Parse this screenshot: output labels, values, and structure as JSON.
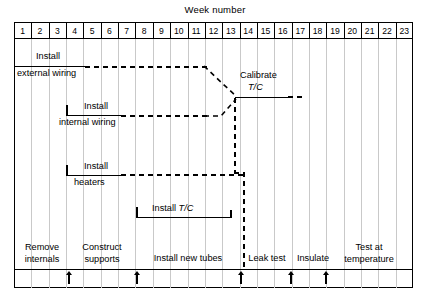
{
  "chart_data": {
    "type": "gantt",
    "title": "Week number",
    "xlabel": "Week number",
    "ylabel": "",
    "grid": true,
    "x_axis": {
      "label": "Week number",
      "ticks": [
        "1",
        "2",
        "3",
        "4",
        "5",
        "6",
        "7",
        "8",
        "9",
        "10",
        "11",
        "12",
        "13",
        "14",
        "15",
        "16",
        "17",
        "18",
        "19",
        "20",
        "21",
        "22",
        "23"
      ],
      "range": [
        1,
        23
      ],
      "unit": "week"
    },
    "tasks": [
      {
        "name": "Install external wiring",
        "label_line1": "Install",
        "label_line2": "external wiring",
        "solid_start_week": 1,
        "solid_end_week": 5,
        "dashed_end_week": 13,
        "row": 1
      },
      {
        "name": "Install internal wiring",
        "label_line1": "Install",
        "label_line2": "internal wiring",
        "solid_start_week": 4,
        "solid_end_week": 7,
        "dashed_end_week": 13,
        "row": 2
      },
      {
        "name": "Install heaters",
        "label_line1": "Install",
        "label_line2": "heaters",
        "solid_start_week": 4,
        "solid_end_week": 7,
        "dashed_end_week": 14,
        "row": 3
      },
      {
        "name": "Install T/C",
        "label_line1": "Install",
        "label_line2": "T/C",
        "label_italic": "T/C",
        "solid_start_week": 8,
        "solid_end_week": 13,
        "dashed_end_week": 13,
        "row": 4
      },
      {
        "name": "Calibrate T/C",
        "label_line1": "Calibrate",
        "label_line2": "T/C",
        "label_italic": "T/C",
        "solid_start_week": 13,
        "solid_end_week": 17,
        "dashed_end_week": 18,
        "row": 1.5
      }
    ],
    "phases": [
      {
        "name": "Remove internals",
        "line1": "Remove",
        "line2": "internals",
        "start_week": 1,
        "end_week": 4
      },
      {
        "name": "Construct supports",
        "line1": "Construct",
        "line2": "supports",
        "start_week": 4,
        "end_week": 8
      },
      {
        "name": "Install new tubes",
        "line1": "Install new tubes",
        "line2": "",
        "start_week": 8,
        "end_week": 14
      },
      {
        "name": "Leak test",
        "line1": "Leak test",
        "line2": "",
        "start_week": 14,
        "end_week": 17
      },
      {
        "name": "Insulate",
        "line1": "Insulate",
        "line2": "",
        "start_week": 17,
        "end_week": 19
      },
      {
        "name": "Test at temperature",
        "line1": "Test at",
        "line2": "temperature",
        "start_week": 19,
        "end_week": 23
      }
    ],
    "milestones_weeks": [
      4,
      8,
      14,
      17,
      19
    ]
  },
  "title": {
    "text": "Week number"
  },
  "weeks": {
    "w1": "1",
    "w2": "2",
    "w3": "3",
    "w4": "4",
    "w5": "5",
    "w6": "6",
    "w7": "7",
    "w8": "8",
    "w9": "9",
    "w10": "10",
    "w11": "11",
    "w12": "12",
    "w13": "13",
    "w14": "14",
    "w15": "15",
    "w16": "16",
    "w17": "17",
    "w18": "18",
    "w19": "19",
    "w20": "20",
    "w21": "21",
    "w22": "22",
    "w23": "23"
  },
  "bars": {
    "external_wiring": {
      "line1": "Install",
      "line2": "external wiring"
    },
    "internal_wiring": {
      "line1": "Install",
      "line2": "internal wiring"
    },
    "heaters": {
      "line1": "Install",
      "line2": "heaters"
    },
    "install_tc": {
      "prefix": "Install",
      "italic": "T/C"
    },
    "calibrate_tc": {
      "line1": "Calibrate",
      "italic": "T/C"
    }
  },
  "phases": {
    "remove_internals": {
      "line1": "Remove",
      "line2": "internals"
    },
    "construct_supports": {
      "line1": "Construct",
      "line2": "supports"
    },
    "install_new_tubes": {
      "line1": "Install new tubes"
    },
    "leak_test": {
      "line1": "Leak test"
    },
    "insulate": {
      "line1": "Insulate"
    },
    "test_at_temp": {
      "line1": "Test at",
      "line2": "temperature"
    }
  },
  "colors": {
    "ink": "#000000",
    "grid": "#c9c9c9",
    "background": "#ffffff"
  }
}
